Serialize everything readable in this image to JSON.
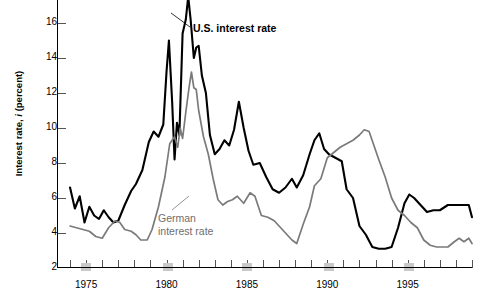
{
  "chart_data": {
    "type": "line",
    "title": "",
    "xlabel": "",
    "ylabel": "Interest rate, i (percent)",
    "ylabel_prefix": "Interest rate, ",
    "ylabel_italic": "i",
    "ylabel_suffix": " (percent)",
    "xlim": [
      1973.5,
      1999.0
    ],
    "ylim": [
      2,
      17
    ],
    "grid": false,
    "legend_position": "inline-annotations",
    "y_ticks": [
      2,
      4,
      6,
      8,
      10,
      12,
      14,
      16
    ],
    "y_tick_labels": [
      "2",
      "4",
      "6",
      "8",
      "10",
      "12",
      "14",
      "16"
    ],
    "x_ticks": [
      1974,
      1975,
      1976,
      1977,
      1978,
      1979,
      1980,
      1981,
      1982,
      1983,
      1984,
      1985,
      1986,
      1987,
      1988,
      1989,
      1990,
      1991,
      1992,
      1993,
      1994,
      1995,
      1996,
      1997,
      1998,
      1999
    ],
    "x_tick_labels_shown": [
      "1975",
      "1980",
      "1985",
      "1990",
      "1995"
    ],
    "x_labeled_years": [
      1975,
      1980,
      1985,
      1990,
      1995
    ],
    "recession_bands": [
      {
        "start": 1974.7,
        "end": 1975.3
      },
      {
        "start": 1979.8,
        "end": 1980.4
      },
      {
        "start": 1984.7,
        "end": 1985.3
      },
      {
        "start": 1989.8,
        "end": 1990.4
      },
      {
        "start": 1994.8,
        "end": 1995.4
      }
    ],
    "series": [
      {
        "name": "U.S. interest rate",
        "color": "#000000",
        "annotation": "U.S. interest rate",
        "points": [
          [
            1974.0,
            6.6
          ],
          [
            1974.3,
            5.4
          ],
          [
            1974.6,
            6.1
          ],
          [
            1974.9,
            4.6
          ],
          [
            1975.2,
            5.5
          ],
          [
            1975.5,
            5.0
          ],
          [
            1975.8,
            4.8
          ],
          [
            1976.1,
            5.3
          ],
          [
            1976.4,
            4.9
          ],
          [
            1976.7,
            4.6
          ],
          [
            1977.0,
            4.7
          ],
          [
            1977.4,
            5.6
          ],
          [
            1977.8,
            6.4
          ],
          [
            1978.1,
            6.8
          ],
          [
            1978.5,
            7.6
          ],
          [
            1978.9,
            9.2
          ],
          [
            1979.2,
            9.8
          ],
          [
            1979.5,
            9.5
          ],
          [
            1979.8,
            10.2
          ],
          [
            1980.0,
            13.2
          ],
          [
            1980.15,
            15.0
          ],
          [
            1980.35,
            11.5
          ],
          [
            1980.5,
            8.2
          ],
          [
            1980.65,
            10.3
          ],
          [
            1980.8,
            9.6
          ],
          [
            1981.0,
            15.4
          ],
          [
            1981.2,
            16.2
          ],
          [
            1981.35,
            17.5
          ],
          [
            1981.5,
            16.2
          ],
          [
            1981.7,
            14.0
          ],
          [
            1981.85,
            14.6
          ],
          [
            1982.0,
            14.7
          ],
          [
            1982.2,
            13.0
          ],
          [
            1982.45,
            12.0
          ],
          [
            1982.7,
            9.6
          ],
          [
            1983.0,
            8.5
          ],
          [
            1983.3,
            8.8
          ],
          [
            1983.6,
            9.3
          ],
          [
            1983.9,
            9.0
          ],
          [
            1984.2,
            9.9
          ],
          [
            1984.5,
            11.5
          ],
          [
            1984.8,
            10.0
          ],
          [
            1985.1,
            8.7
          ],
          [
            1985.4,
            7.9
          ],
          [
            1985.8,
            8.0
          ],
          [
            1986.2,
            7.2
          ],
          [
            1986.6,
            6.5
          ],
          [
            1987.0,
            6.3
          ],
          [
            1987.4,
            6.6
          ],
          [
            1987.8,
            7.1
          ],
          [
            1988.1,
            6.6
          ],
          [
            1988.5,
            7.3
          ],
          [
            1988.9,
            8.5
          ],
          [
            1989.2,
            9.3
          ],
          [
            1989.5,
            9.7
          ],
          [
            1989.8,
            8.8
          ],
          [
            1990.1,
            8.5
          ],
          [
            1990.5,
            8.3
          ],
          [
            1990.9,
            8.1
          ],
          [
            1991.2,
            6.5
          ],
          [
            1991.6,
            6.0
          ],
          [
            1992.0,
            4.4
          ],
          [
            1992.4,
            3.9
          ],
          [
            1992.8,
            3.2
          ],
          [
            1993.2,
            3.1
          ],
          [
            1993.6,
            3.1
          ],
          [
            1994.0,
            3.2
          ],
          [
            1994.4,
            4.3
          ],
          [
            1994.8,
            5.7
          ],
          [
            1995.1,
            6.2
          ],
          [
            1995.4,
            6.0
          ],
          [
            1995.8,
            5.6
          ],
          [
            1996.2,
            5.2
          ],
          [
            1996.6,
            5.3
          ],
          [
            1997.0,
            5.3
          ],
          [
            1997.5,
            5.6
          ],
          [
            1998.0,
            5.6
          ],
          [
            1998.5,
            5.6
          ],
          [
            1998.8,
            5.6
          ],
          [
            1999.0,
            4.9
          ]
        ]
      },
      {
        "name": "German interest rate",
        "color": "#7a7a7a",
        "annotation_line1": "German",
        "annotation_line2": "interest rate",
        "points": [
          [
            1974.0,
            4.4
          ],
          [
            1974.4,
            4.3
          ],
          [
            1974.8,
            4.2
          ],
          [
            1975.2,
            4.1
          ],
          [
            1975.6,
            3.8
          ],
          [
            1976.0,
            3.7
          ],
          [
            1976.4,
            4.3
          ],
          [
            1976.8,
            4.7
          ],
          [
            1977.1,
            4.6
          ],
          [
            1977.4,
            4.2
          ],
          [
            1977.8,
            4.1
          ],
          [
            1978.1,
            3.9
          ],
          [
            1978.4,
            3.6
          ],
          [
            1978.8,
            3.6
          ],
          [
            1979.1,
            4.2
          ],
          [
            1979.5,
            5.5
          ],
          [
            1979.9,
            7.2
          ],
          [
            1980.2,
            9.1
          ],
          [
            1980.5,
            9.5
          ],
          [
            1980.7,
            8.9
          ],
          [
            1980.85,
            10.0
          ],
          [
            1981.0,
            9.4
          ],
          [
            1981.2,
            10.9
          ],
          [
            1981.4,
            12.3
          ],
          [
            1981.55,
            13.2
          ],
          [
            1981.7,
            12.3
          ],
          [
            1981.85,
            12.2
          ],
          [
            1982.0,
            11.0
          ],
          [
            1982.3,
            9.5
          ],
          [
            1982.6,
            8.5
          ],
          [
            1982.9,
            7.1
          ],
          [
            1983.2,
            5.9
          ],
          [
            1983.5,
            5.6
          ],
          [
            1983.8,
            5.8
          ],
          [
            1984.1,
            5.9
          ],
          [
            1984.4,
            6.1
          ],
          [
            1984.8,
            5.7
          ],
          [
            1985.2,
            6.3
          ],
          [
            1985.5,
            6.1
          ],
          [
            1985.9,
            5.0
          ],
          [
            1986.3,
            4.9
          ],
          [
            1986.7,
            4.7
          ],
          [
            1987.0,
            4.4
          ],
          [
            1987.4,
            4.0
          ],
          [
            1987.8,
            3.6
          ],
          [
            1988.1,
            3.4
          ],
          [
            1988.5,
            4.5
          ],
          [
            1988.9,
            5.5
          ],
          [
            1989.2,
            6.7
          ],
          [
            1989.6,
            7.1
          ],
          [
            1990.0,
            8.3
          ],
          [
            1990.4,
            8.6
          ],
          [
            1990.8,
            8.9
          ],
          [
            1991.2,
            9.1
          ],
          [
            1991.6,
            9.3
          ],
          [
            1992.0,
            9.6
          ],
          [
            1992.3,
            9.9
          ],
          [
            1992.6,
            9.8
          ],
          [
            1992.9,
            9.0
          ],
          [
            1993.2,
            8.2
          ],
          [
            1993.6,
            7.2
          ],
          [
            1994.0,
            6.0
          ],
          [
            1994.4,
            5.3
          ],
          [
            1994.8,
            5.0
          ],
          [
            1995.2,
            4.6
          ],
          [
            1995.6,
            4.3
          ],
          [
            1996.0,
            3.6
          ],
          [
            1996.4,
            3.3
          ],
          [
            1996.8,
            3.2
          ],
          [
            1997.1,
            3.2
          ],
          [
            1997.5,
            3.2
          ],
          [
            1997.9,
            3.5
          ],
          [
            1998.2,
            3.7
          ],
          [
            1998.5,
            3.5
          ],
          [
            1998.8,
            3.7
          ],
          [
            1999.0,
            3.4
          ]
        ]
      }
    ]
  }
}
